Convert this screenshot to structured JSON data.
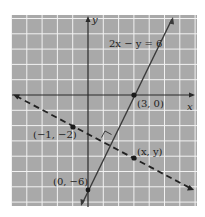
{
  "figure": {
    "equation_label": "2x − y = 6",
    "axis_x_label": "x",
    "axis_y_label": "y",
    "points": [
      {
        "label": "(3, 0)",
        "x": 3,
        "y": 0
      },
      {
        "label": "(−1, −2)",
        "x": -1,
        "y": -2
      },
      {
        "label": "(x, y)",
        "x": 3,
        "y": -4
      },
      {
        "label": "(0, −6)",
        "x": 0,
        "y": -6
      }
    ],
    "solid_line": {
      "equation": "2x − y = 6",
      "style": "solid"
    },
    "dashed_line": {
      "through": "(−1, −2)",
      "slope": "−1/2",
      "style": "dashed"
    },
    "right_angle_marker": true,
    "colors": {
      "grid_bg": "#a9a9a9",
      "grid_line": "#f2f2f2",
      "ink": "#2a2a2a"
    }
  }
}
